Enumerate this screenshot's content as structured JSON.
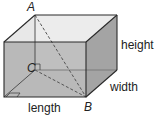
{
  "diagram": {
    "type": "rectangular-prism",
    "points": {
      "A": "A",
      "B": "B",
      "C": "C"
    },
    "dimensions": {
      "height": "height",
      "width": "width",
      "length": "length"
    },
    "colors": {
      "front_face": "#b9b9b9",
      "top_face": "#eeeeee",
      "side_face": "#a6a6a6",
      "back_inner": "#dadada",
      "bottom_inner": "#c6c6c6",
      "edge": "#333333",
      "dashed": "#555555"
    }
  }
}
